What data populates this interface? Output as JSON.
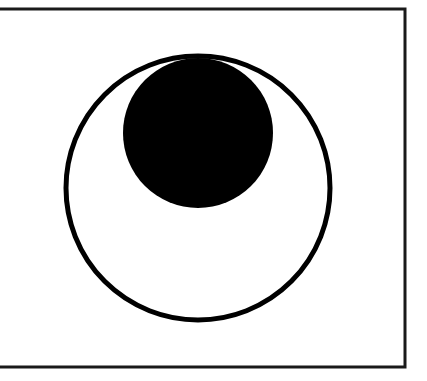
{
  "figure": {
    "background": "#ffffff",
    "frame": {
      "stroke": "#1a1a1a",
      "stroke_width": 3,
      "top_y": 9,
      "bottom_y": 367,
      "left_x": 0,
      "right_x": 405,
      "sides_visible": [
        "top",
        "right",
        "bottom"
      ]
    },
    "outer_circle": {
      "cx": 198,
      "cy": 188,
      "r": 132,
      "fill": "none",
      "stroke": "#000000",
      "stroke_width": 5
    },
    "inner_disk": {
      "cx": 198,
      "cy": 133,
      "r": 75,
      "fill": "#000000"
    }
  }
}
